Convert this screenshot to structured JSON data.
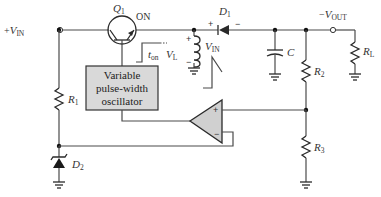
{
  "diagram": {
    "colors": {
      "wire": "#4a4a4a",
      "component": "#2a2a2a",
      "box_fill": "#d9d9d9",
      "opamp_fill": "#d0d0d0",
      "background": "#ffffff"
    },
    "terminals": {
      "input": {
        "sign": "+",
        "symbol": "V",
        "subscript": "IN"
      },
      "output": {
        "sign": "−",
        "symbol": "V",
        "subscript": "OUT"
      }
    },
    "components": {
      "transistor": {
        "name": "Q",
        "subscript": "1",
        "state": "ON"
      },
      "pulse_label": {
        "symbol": "t",
        "subscript": "on"
      },
      "inductor_voltage": {
        "symbol": "V",
        "subscript": "L",
        "plus": "+",
        "minus": "−"
      },
      "ramp_label": {
        "symbol": "V",
        "subscript": "IN"
      },
      "diode": {
        "name": "D",
        "subscript": "1",
        "plus": "+",
        "minus": "−"
      },
      "capacitor": {
        "name": "C"
      },
      "r1": {
        "name": "R",
        "subscript": "1"
      },
      "r2": {
        "name": "R",
        "subscript": "2"
      },
      "r3": {
        "name": "R",
        "subscript": "3"
      },
      "rl": {
        "name": "R",
        "subscript": "L"
      },
      "zener": {
        "name": "D",
        "subscript": "2"
      },
      "oscillator": {
        "line1": "Variable",
        "line2": "pulse-width",
        "line3": "oscillator"
      },
      "opamp": {
        "plus": "+",
        "minus": "−"
      }
    }
  }
}
